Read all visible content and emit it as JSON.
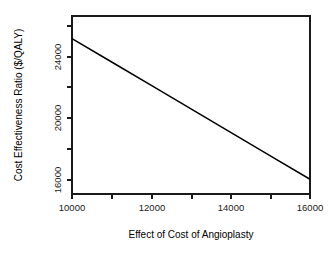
{
  "chart_data": {
    "type": "line",
    "title": "",
    "subtitle": "",
    "xlabel": "Effect of Cost of Angioplasty",
    "ylabel": "Cost Effectiveness Ratio ($/QALY)",
    "xlim": [
      10000,
      16000
    ],
    "ylim": [
      15700,
      25400
    ],
    "grid": false,
    "legend": null,
    "legend_position": "none",
    "x_major_ticks": [
      10000,
      12000,
      14000,
      16000
    ],
    "x_major_tick_labels": [
      "10000",
      "12000",
      "14000",
      "16000"
    ],
    "x_minor_ticks": [
      11000,
      13000,
      15000
    ],
    "y_major_ticks": [
      16000,
      20000,
      24000
    ],
    "y_major_tick_labels": [
      "16000",
      "20000",
      "24000"
    ],
    "y_minor_ticks": [
      18000,
      22000
    ],
    "series": [
      {
        "name": "Cost Effectiveness Ratio",
        "color": "#000000",
        "x": [
          10000,
          11000,
          12000,
          13000,
          14000,
          15000,
          16000
        ],
        "values": [
          25200,
          23675,
          22150,
          20625,
          19100,
          17575,
          16050
        ]
      }
    ]
  },
  "axes": {
    "x_title": "Effect of Cost of Angioplasty",
    "y_title": "Cost Effectiveness Ratio ($/QALY)"
  },
  "tick_labels": {
    "x": [
      "10000",
      "12000",
      "14000",
      "16000"
    ],
    "y": [
      "16000",
      "20000",
      "24000"
    ]
  }
}
